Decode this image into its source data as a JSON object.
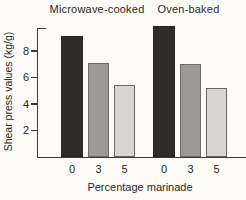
{
  "chart_data": {
    "type": "bar",
    "title": "",
    "xlabel": "Percentage marinade",
    "ylabel": "Shear press values (kg/g)",
    "ylim": [
      0,
      10
    ],
    "yticks": [
      2,
      4,
      6,
      8
    ],
    "grid": false,
    "legend": "none",
    "categories": [
      "0",
      "3",
      "5"
    ],
    "groups": [
      {
        "label": "Microwave-cooked",
        "categories": [
          "0",
          "3",
          "5"
        ],
        "values": [
          9.1,
          7.1,
          5.4
        ]
      },
      {
        "label": "Oven-baked",
        "categories": [
          "0",
          "3",
          "5"
        ],
        "values": [
          9.9,
          7.0,
          5.2
        ]
      }
    ],
    "bar_fill_colors": [
      "#2e2c2a",
      "#9c9a96",
      "#d9d6d2"
    ],
    "bar_border_colors": [
      "#272523",
      "#6f6d69",
      "#6a6864"
    ]
  },
  "colors": {
    "background": "#fcfbf8",
    "text": "#2b2926",
    "axis": "#3c3a36"
  }
}
